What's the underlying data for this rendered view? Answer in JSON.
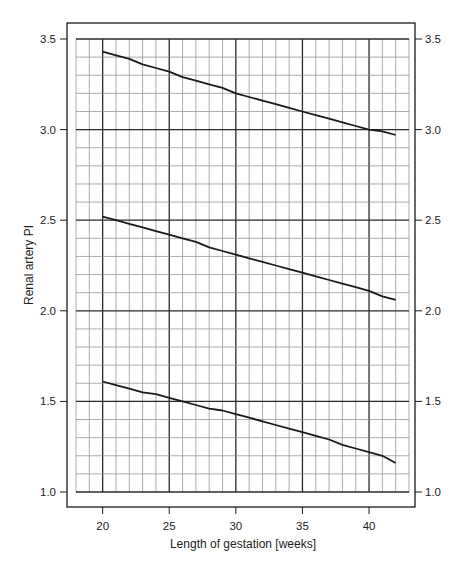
{
  "chart_data": {
    "type": "line",
    "title": "",
    "xlabel": "Length of gestation [weeks]",
    "ylabel": "Renal artery PI",
    "xlim": [
      18,
      43
    ],
    "ylim": [
      1.0,
      3.5
    ],
    "x_ticks": [
      20,
      25,
      30,
      35,
      40
    ],
    "y_ticks": [
      1.0,
      1.5,
      2.0,
      2.5,
      3.0,
      3.5
    ],
    "y_tick_labels": [
      "1.0",
      "1.5",
      "2.0",
      "2.5",
      "3.0",
      "3.5"
    ],
    "right_axis_mirror": true,
    "grid": {
      "x_minor_step": 1,
      "x_major_step": 5,
      "y_minor_step": 0.1,
      "y_major_step": 0.5
    },
    "legend": null,
    "x": [
      20,
      21,
      22,
      23,
      24,
      25,
      26,
      27,
      28,
      29,
      30,
      31,
      32,
      33,
      34,
      35,
      36,
      37,
      38,
      39,
      40,
      41,
      42
    ],
    "series": [
      {
        "name": "upper reference line",
        "values": [
          3.43,
          3.41,
          3.39,
          3.36,
          3.34,
          3.32,
          3.29,
          3.27,
          3.25,
          3.23,
          3.2,
          3.18,
          3.16,
          3.14,
          3.12,
          3.1,
          3.08,
          3.06,
          3.04,
          3.02,
          3.0,
          2.99,
          2.97
        ]
      },
      {
        "name": "median reference line",
        "values": [
          2.52,
          2.5,
          2.48,
          2.46,
          2.44,
          2.42,
          2.4,
          2.38,
          2.35,
          2.33,
          2.31,
          2.29,
          2.27,
          2.25,
          2.23,
          2.21,
          2.19,
          2.17,
          2.15,
          2.13,
          2.11,
          2.08,
          2.06
        ]
      },
      {
        "name": "lower reference line",
        "values": [
          1.61,
          1.59,
          1.57,
          1.55,
          1.54,
          1.52,
          1.5,
          1.48,
          1.46,
          1.45,
          1.43,
          1.41,
          1.39,
          1.37,
          1.35,
          1.33,
          1.31,
          1.29,
          1.26,
          1.24,
          1.22,
          1.2,
          1.16
        ]
      }
    ],
    "colors": {
      "line": "#1a1a1a",
      "grid_minor": "#8a8a8a",
      "grid_major": "#2a2a2a",
      "frame": "#1a1a1a"
    }
  }
}
